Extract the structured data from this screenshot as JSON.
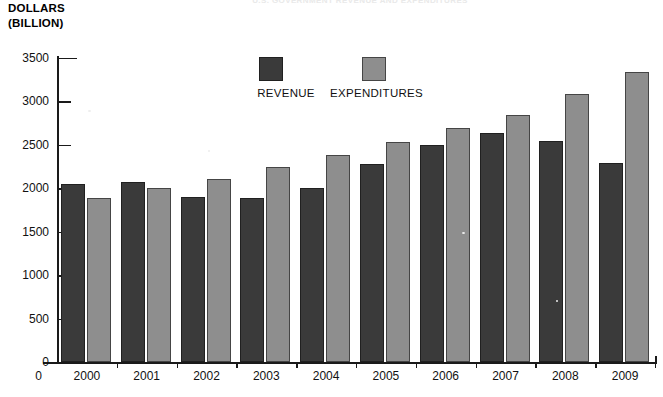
{
  "top_title": "U.S. GOVERNMENT REVENUE AND EXPENDITURES",
  "axis_titles": {
    "y_line1": "DOLLARS",
    "y_line2": "(BILLION)"
  },
  "legend": {
    "items": [
      {
        "label": "REVENUE",
        "color": "#3a3a3a",
        "swatch_name": "legend-swatch-revenue"
      },
      {
        "label": "EXPENDITURES",
        "color": "#8e8e8e",
        "swatch_name": "legend-swatch-expenditures"
      }
    ]
  },
  "y_axis": {
    "ticks": [
      "3500",
      "3000",
      "2500",
      "2000",
      "1500",
      "1000",
      "500",
      "0"
    ],
    "min": 0,
    "max": 3500,
    "step": 500
  },
  "x_axis": {
    "zero_label": "0",
    "ticks": [
      "2000",
      "2001",
      "2002",
      "2003",
      "2004",
      "2005",
      "2006",
      "2007",
      "2008",
      "2009"
    ]
  },
  "chart_data": {
    "type": "bar",
    "title": "U.S. GOVERNMENT REVENUE AND EXPENDITURES",
    "xlabel": "",
    "ylabel": "DOLLARS (BILLION)",
    "ylim": [
      0,
      3500
    ],
    "ytick_step": 500,
    "grid": false,
    "legend_position": "top-center",
    "categories": [
      "2000",
      "2001",
      "2002",
      "2003",
      "2004",
      "2005",
      "2006",
      "2007",
      "2008",
      "2009"
    ],
    "series": [
      {
        "name": "REVENUE",
        "color": "#3a3a3a",
        "values": [
          2050,
          2070,
          1900,
          1890,
          2000,
          2280,
          2500,
          2640,
          2540,
          2290
        ]
      },
      {
        "name": "EXPENDITURES",
        "color": "#8e8e8e",
        "values": [
          1890,
          2000,
          2110,
          2250,
          2380,
          2530,
          2700,
          2840,
          3080,
          3340
        ]
      }
    ]
  }
}
